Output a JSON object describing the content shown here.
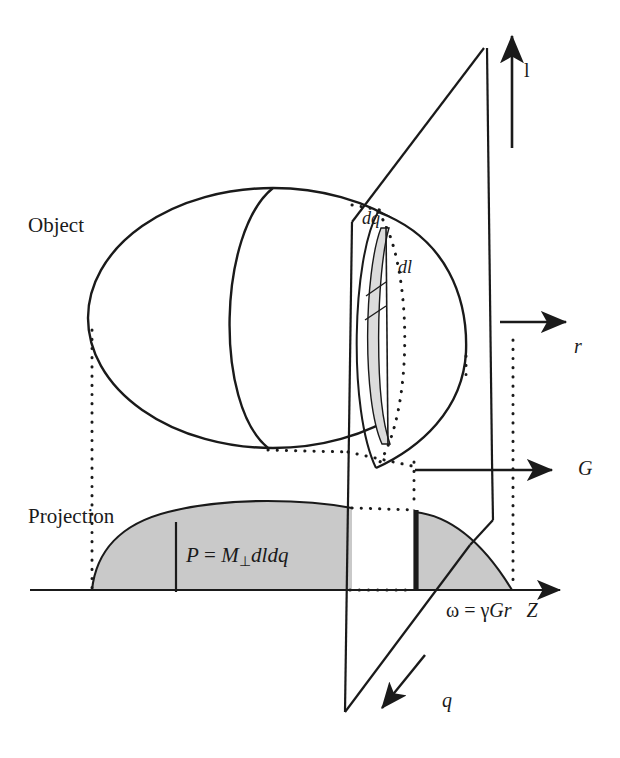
{
  "figure": {
    "kind": "mri-projection-diagram",
    "background_color": "#ffffff",
    "stroke_color": "#1a1a1a",
    "fill_shade": "#c9c9c9",
    "fill_shade_light": "#dcdcdc"
  },
  "labels": {
    "object": "Object",
    "projection": "Projection",
    "dq": "dq",
    "dl": "dl",
    "axis_l": "l",
    "axis_r": "r",
    "axis_G": "G",
    "axis_q": "q",
    "axis_Z": "Z"
  },
  "formulas": {
    "projection_amplitude_P": "P",
    "projection_amplitude_eq": "=",
    "projection_amplitude_M": "M",
    "projection_amplitude_M_sub": "⊥",
    "projection_amplitude_dldq": "dldq",
    "projection_amplitude_full": "P = M⊥dldq",
    "frequency_omega": "ω",
    "frequency_eq": "=",
    "frequency_gamma": "γ",
    "frequency_Gr": "Gr",
    "frequency_full": "ω = γGr"
  },
  "geometry": {
    "object_ellipse": {
      "cx": 273,
      "cy": 318,
      "rx": 185,
      "ry": 130
    },
    "slice_plane_corners": [
      [
        484,
        48
      ],
      [
        352,
        222
      ],
      [
        345,
        710
      ],
      [
        492,
        540
      ]
    ],
    "vertical_l_arrow": {
      "x": 512,
      "y_tail": 145,
      "y_tip": 30
    },
    "horizontal_r_arrow": {
      "x_tail": 500,
      "x_tip": 572,
      "y": 322
    },
    "horizontal_G_arrow": {
      "x_tail": 415,
      "x_tip": 558,
      "y": 470
    },
    "diagonal_q_arrow": {
      "x_tail": 420,
      "y_tail": 662,
      "x_tip": 378,
      "y_tip": 712
    },
    "z_axis": {
      "x_start": 30,
      "x_tip": 565,
      "y": 590
    },
    "left_projection_peak_y": 508,
    "left_projection_start_x": 92,
    "right_projection_bar_x": 415,
    "right_projection_end_x": 512,
    "tick_x": 176
  }
}
